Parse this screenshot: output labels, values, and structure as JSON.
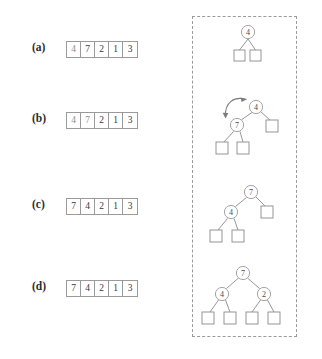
{
  "figure": {
    "rows": [
      {
        "label": "(a)",
        "array": {
          "values": [
            "4",
            "7",
            "2",
            "1",
            "3"
          ],
          "dim_indices": [
            0
          ]
        },
        "tree": {
          "nodes": [
            {
              "id": "n0",
              "value": "4",
              "cx": 52,
              "cy": 12
            }
          ],
          "leaves": [
            {
              "id": "l0",
              "x": 38,
              "y": 30
            },
            {
              "id": "l1",
              "x": 54,
              "y": 30
            }
          ],
          "edges": [
            {
              "from": "n0",
              "to": "l0"
            },
            {
              "from": "n0",
              "to": "l1"
            }
          ],
          "arrow": null
        }
      },
      {
        "label": "(b)",
        "array": {
          "values": [
            "4",
            "7",
            "2",
            "1",
            "3"
          ],
          "dim_indices": [
            0,
            1
          ]
        },
        "tree": {
          "nodes": [
            {
              "id": "n0",
              "value": "4",
              "cx": 60,
              "cy": 17
            },
            {
              "id": "n1",
              "value": "7",
              "cx": 41,
              "cy": 35
            }
          ],
          "leaves": [
            {
              "id": "l0",
              "x": 70,
              "y": 30
            },
            {
              "id": "l1",
              "x": 20,
              "y": 52
            },
            {
              "id": "l2",
              "x": 41,
              "y": 52
            }
          ],
          "edges": [
            {
              "from": "n0",
              "to": "n1"
            },
            {
              "from": "n0",
              "to": "l0"
            },
            {
              "from": "n1",
              "to": "l1"
            },
            {
              "from": "n1",
              "to": "l2"
            }
          ],
          "arrow": {
            "type": "swap-arrow",
            "label": "swap 4 and 7"
          }
        }
      },
      {
        "label": "(c)",
        "array": {
          "values": [
            "7",
            "4",
            "2",
            "1",
            "3"
          ],
          "dim_indices": []
        },
        "tree": {
          "nodes": [
            {
              "id": "n0",
              "value": "7",
              "cx": 55,
              "cy": 10
            },
            {
              "id": "n1",
              "value": "4",
              "cx": 35,
              "cy": 30
            }
          ],
          "leaves": [
            {
              "id": "l0",
              "x": 65,
              "y": 24
            },
            {
              "id": "l1",
              "x": 14,
              "y": 48
            },
            {
              "id": "l2",
              "x": 36,
              "y": 48
            }
          ],
          "edges": [
            {
              "from": "n0",
              "to": "n1"
            },
            {
              "from": "n0",
              "to": "l0"
            },
            {
              "from": "n1",
              "to": "l1"
            },
            {
              "from": "n1",
              "to": "l2"
            }
          ],
          "arrow": null
        }
      },
      {
        "label": "(d)",
        "array": {
          "values": [
            "7",
            "4",
            "2",
            "1",
            "3"
          ],
          "dim_indices": []
        },
        "tree": {
          "nodes": [
            {
              "id": "n0",
              "value": "7",
              "cx": 47,
              "cy": 11
            },
            {
              "id": "n1",
              "value": "4",
              "cx": 26,
              "cy": 32
            },
            {
              "id": "n2",
              "value": "2",
              "cx": 68,
              "cy": 32
            }
          ],
          "leaves": [
            {
              "id": "l0",
              "x": 6,
              "y": 50
            },
            {
              "id": "l1",
              "x": 28,
              "y": 50
            },
            {
              "id": "l2",
              "x": 50,
              "y": 50
            },
            {
              "id": "l3",
              "x": 72,
              "y": 50
            }
          ],
          "edges": [
            {
              "from": "n0",
              "to": "n1"
            },
            {
              "from": "n0",
              "to": "n2"
            },
            {
              "from": "n1",
              "to": "l0"
            },
            {
              "from": "n1",
              "to": "l1"
            },
            {
              "from": "n2",
              "to": "l2"
            },
            {
              "from": "n2",
              "to": "l3"
            }
          ],
          "arrow": null
        }
      }
    ],
    "colors": {
      "stroke": "#9a9a9a",
      "text": "#3a3a3a",
      "label": "#2b2b2b",
      "arrow": "#7d7d7d",
      "dashed_box": "#9a9a9a",
      "background": "#ffffff"
    }
  }
}
